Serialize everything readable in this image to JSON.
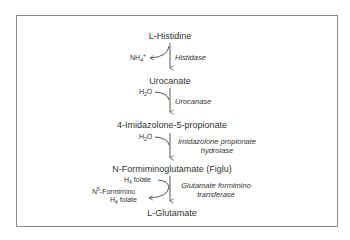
{
  "diagram": {
    "compounds": [
      {
        "name": "L-Histidine"
      },
      {
        "name": "Urocanate"
      },
      {
        "name": "4-Imidazolone-5-propionate"
      },
      {
        "name": "N-Formiminoglutamate (Figlu)"
      },
      {
        "name": "L-Glutamate"
      }
    ],
    "steps": [
      {
        "enzyme": "Histidase",
        "side_out": "NH",
        "side_out_sub": "4",
        "side_out_sup": "+"
      },
      {
        "enzyme": "Urocanase",
        "side_in": "H",
        "side_in_sub": "2",
        "side_in_tail": "O"
      },
      {
        "enzyme_line1": "Imidazolone propionate",
        "enzyme_line2": "hydrolase",
        "side_in": "H",
        "side_in_sub": "2",
        "side_in_tail": "O"
      },
      {
        "enzyme_line1": "Glutamate formimino",
        "enzyme_line2": "transferase",
        "side_in": "H",
        "side_in_sub": "4",
        "side_in_tail": " folate",
        "side_out_pre": "N",
        "side_out_sup": "5",
        "side_out_line1": "-Formimino",
        "side_out_line2_pre": "H",
        "side_out_line2_sub": "4",
        "side_out_line2": " folate"
      }
    ]
  }
}
